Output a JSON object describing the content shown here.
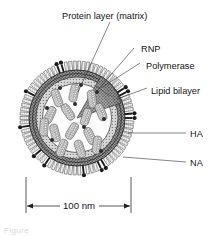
{
  "figure": {
    "background_color": "#ffffff",
    "ink_color": "#141414",
    "caption_fragment": "Figure"
  },
  "labels": {
    "protein_layer": "Protein layer (matrix)",
    "rnp": "RNP",
    "polymerase": "Polymerase",
    "lipid_bilayer": "Lipid bilayer",
    "ha": "HA",
    "na": "NA"
  },
  "scale_bar": {
    "value": "100 nm"
  },
  "structure": {
    "center_x": 77,
    "center_y": 118,
    "envelope_outer_r": 48,
    "envelope_inner_r": 41,
    "matrix_inner_r": 35,
    "core_r": 34,
    "spike_len": 9,
    "ha_spike_count": 78,
    "na_spike_count": 9,
    "rnp_segment_count": 14,
    "polymerase_dot_count": 9,
    "colors": {
      "envelope_fill": "#8a8a8a",
      "matrix_fill": "#c9c9c9",
      "core_fill": "#fbfbfb",
      "rnp_fill": "#d4d4d4",
      "spike_fill": "#efefef",
      "na_fill": "#1b1b1b",
      "outline": "#2a2a2a"
    }
  },
  "rnp_segments": [
    {
      "x": 57,
      "y": 98,
      "a": -20
    },
    {
      "x": 74,
      "y": 93,
      "a": 12
    },
    {
      "x": 92,
      "y": 99,
      "a": -8
    },
    {
      "x": 50,
      "y": 115,
      "a": 25
    },
    {
      "x": 68,
      "y": 112,
      "a": -34
    },
    {
      "x": 86,
      "y": 117,
      "a": 18
    },
    {
      "x": 101,
      "y": 112,
      "a": -22
    },
    {
      "x": 55,
      "y": 133,
      "a": -14
    },
    {
      "x": 72,
      "y": 131,
      "a": 30
    },
    {
      "x": 90,
      "y": 136,
      "a": -26
    },
    {
      "x": 62,
      "y": 148,
      "a": 20
    },
    {
      "x": 80,
      "y": 149,
      "a": -18
    },
    {
      "x": 97,
      "y": 145,
      "a": 8
    },
    {
      "x": 44,
      "y": 127,
      "a": 5
    }
  ],
  "polymerase_dots": [
    {
      "x": 60,
      "y": 88
    },
    {
      "x": 81,
      "y": 85
    },
    {
      "x": 97,
      "y": 92
    },
    {
      "x": 47,
      "y": 108
    },
    {
      "x": 75,
      "y": 104
    },
    {
      "x": 104,
      "y": 119
    },
    {
      "x": 52,
      "y": 140
    },
    {
      "x": 84,
      "y": 127
    },
    {
      "x": 101,
      "y": 151
    }
  ],
  "na_spikes": [
    {
      "angle": -118
    },
    {
      "angle": -97
    },
    {
      "angle": -56
    },
    {
      "angle": -40
    },
    {
      "angle": -8
    },
    {
      "angle": 26
    },
    {
      "angle": 72
    },
    {
      "angle": 150
    },
    {
      "angle": 178
    }
  ]
}
